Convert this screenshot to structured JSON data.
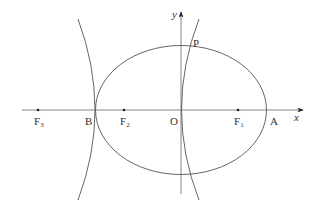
{
  "diagram": {
    "type": "conic-sections",
    "axes": {
      "x_label": "x",
      "y_label": "y",
      "origin_label": "O"
    },
    "points": [
      {
        "id": "F3",
        "label": "F",
        "sub": "3"
      },
      {
        "id": "B",
        "label": "B",
        "sub": ""
      },
      {
        "id": "F2",
        "label": "F",
        "sub": "2"
      },
      {
        "id": "O",
        "label": "O",
        "sub": ""
      },
      {
        "id": "F1",
        "label": "F",
        "sub": "1"
      },
      {
        "id": "A",
        "label": "A",
        "sub": ""
      },
      {
        "id": "P",
        "label": "P",
        "sub": ""
      }
    ],
    "curves": [
      {
        "name": "ellipse",
        "description": "Ellipse centered at O with vertices A and B, foci F1 and F2"
      },
      {
        "name": "hyperbola",
        "description": "Hyperbola with vertices B and O, one focus F3, intersecting ellipse at P"
      }
    ],
    "colors": {
      "stroke": "#555555",
      "text": "#333333"
    }
  }
}
